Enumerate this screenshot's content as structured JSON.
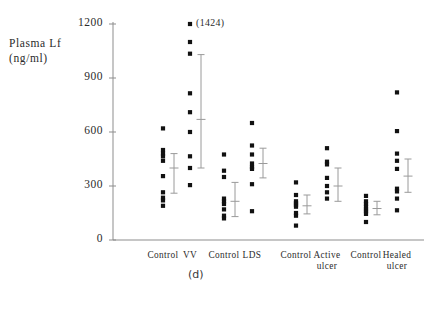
{
  "figure": {
    "panel_label": "(d)",
    "y_axis_title_line1": "Plasma Lf",
    "y_axis_title_line2": "(ng/ml)",
    "outlier_annotation": "(1424)"
  },
  "chart_data": {
    "type": "scatter",
    "title": "",
    "xlabel": "",
    "ylabel": "Plasma Lf (ng/ml)",
    "ylim": [
      0,
      1200
    ],
    "yticks": [
      0,
      300,
      600,
      900,
      1200
    ],
    "ytick_labels": [
      "0",
      "300",
      "600",
      "900",
      "1200"
    ],
    "grid": false,
    "legend": "none",
    "annotations": [
      {
        "text": "(1424)",
        "group": "VV",
        "value": 1424,
        "note": "off-scale point plotted at top"
      }
    ],
    "categories": [
      "Control",
      "VV",
      "Control",
      "LDS",
      "Control",
      "Active ulcer",
      "Control",
      "Healed ulcer"
    ],
    "groups": [
      {
        "name": "Control",
        "label_lines": [
          "Control"
        ],
        "values": [
          620,
          500,
          480,
          465,
          440,
          355,
          265,
          235,
          220,
          190
        ],
        "mean": 400,
        "error_upper": 480,
        "error_lower": 260
      },
      {
        "name": "VV",
        "label_lines": [
          "VV"
        ],
        "values": [
          1424,
          1100,
          1035,
          815,
          710,
          600,
          465,
          400,
          305
        ],
        "mean": 670,
        "error_upper": 1030,
        "error_lower": 400
      },
      {
        "name": "Control",
        "label_lines": [
          "Control"
        ],
        "values": [
          475,
          385,
          350,
          230,
          215,
          200,
          170,
          135,
          120
        ],
        "mean": 215,
        "error_upper": 320,
        "error_lower": 130
      },
      {
        "name": "LDS",
        "label_lines": [
          "LDS"
        ],
        "values": [
          650,
          525,
          475,
          425,
          405,
          395,
          310,
          160
        ],
        "mean": 425,
        "error_upper": 510,
        "error_lower": 345
      },
      {
        "name": "Control",
        "label_lines": [
          "Control"
        ],
        "values": [
          320,
          250,
          215,
          205,
          195,
          185,
          150,
          135,
          80
        ],
        "mean": 190,
        "error_upper": 250,
        "error_lower": 145
      },
      {
        "name": "Active ulcer",
        "label_lines": [
          "Active",
          "ulcer"
        ],
        "values": [
          510,
          435,
          420,
          345,
          300,
          265,
          230
        ],
        "mean": 300,
        "error_upper": 400,
        "error_lower": 215
      },
      {
        "name": "Control",
        "label_lines": [
          "Control"
        ],
        "values": [
          245,
          215,
          200,
          185,
          170,
          160,
          145,
          100
        ],
        "mean": 175,
        "error_upper": 215,
        "error_lower": 140
      },
      {
        "name": "Healed ulcer",
        "label_lines": [
          "Healed",
          "ulcer"
        ],
        "values": [
          820,
          605,
          480,
          440,
          395,
          285,
          270,
          230,
          165
        ],
        "mean": 355,
        "error_upper": 450,
        "error_lower": 265
      }
    ]
  }
}
